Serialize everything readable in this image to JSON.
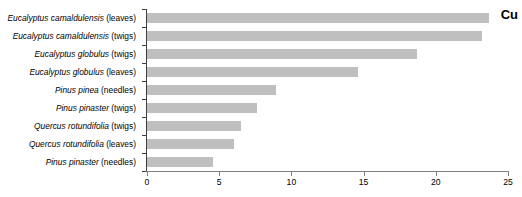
{
  "chart_data": {
    "type": "bar",
    "orientation": "horizontal",
    "title": "Cu",
    "xlabel": "",
    "ylabel": "",
    "xlim": [
      0,
      25
    ],
    "xticks": [
      0,
      5,
      10,
      15,
      20,
      25
    ],
    "grid": false,
    "legend": null,
    "bar_color": "#bfbfbf",
    "axis_color": "#7f7f7f",
    "categories": [
      "Eucalyptus camaldulensis (leaves)",
      "Eucalyptus camaldulensis (twigs)",
      "Eucalyptus globulus (twigs)",
      "Eucalyptus globulus (leaves)",
      "Pinus pinea (needles)",
      "Pinus pinaster (twigs)",
      "Quercus rotundifolia (twigs)",
      "Quercus rotundifolia (leaves)",
      "Pinus pinaster (needles)"
    ],
    "category_parts": [
      {
        "species": "Eucalyptus camaldulensis",
        "part": " (leaves)"
      },
      {
        "species": "Eucalyptus camaldulensis",
        "part": " (twigs)"
      },
      {
        "species": "Eucalyptus globulus",
        "part": " (twigs)"
      },
      {
        "species": "Eucalyptus globulus",
        "part": " (leaves)"
      },
      {
        "species": "Pinus pinea",
        "part": " (needles)"
      },
      {
        "species": "Pinus pinaster",
        "part": " (twigs)"
      },
      {
        "species": "Quercus rotundifolia",
        "part": " (twigs)"
      },
      {
        "species": "Quercus rotundifolia",
        "part": " (leaves)"
      },
      {
        "species": "Pinus pinaster",
        "part": " (needles)"
      }
    ],
    "values": [
      23.7,
      23.2,
      18.7,
      14.6,
      8.9,
      7.6,
      6.5,
      6.0,
      4.6
    ]
  }
}
